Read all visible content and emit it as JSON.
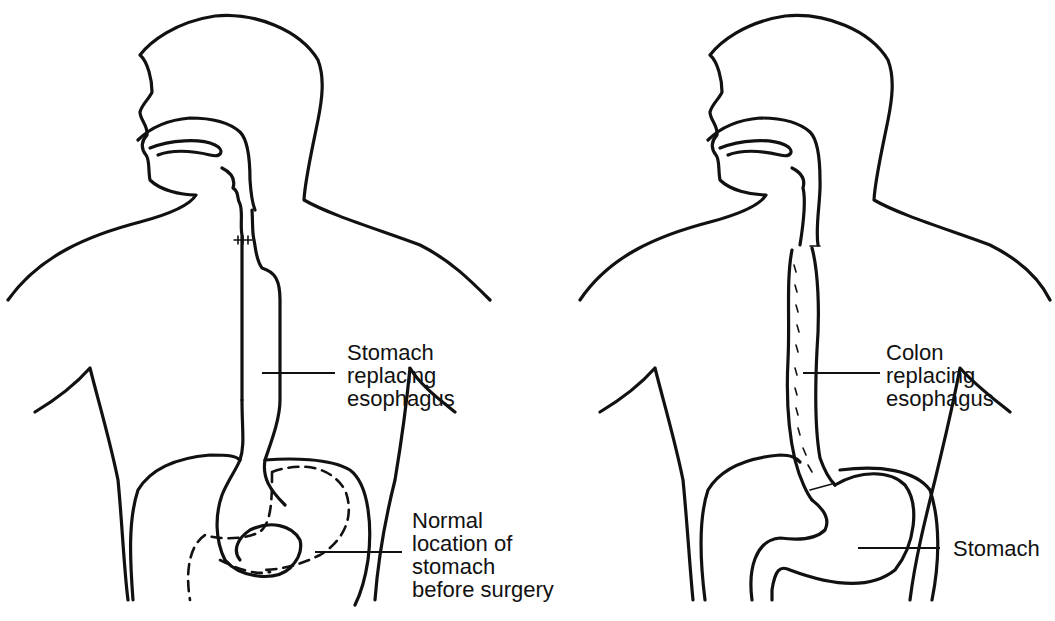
{
  "figures": [
    {
      "id": "left",
      "title": "Esophagus replaced by stomach",
      "labels": {
        "replacement": "Stomach\nreplacing\nesophagus",
        "normal_location": "Normal\nlocation of\nstomach\nbefore surgery"
      }
    },
    {
      "id": "right",
      "title": "Esophagus replaced by colon",
      "labels": {
        "replacement": "Colon\nreplacing\nesophagus",
        "stomach": "Stomach"
      }
    }
  ],
  "colors": {
    "line": "#111111",
    "background": "#ffffff"
  }
}
